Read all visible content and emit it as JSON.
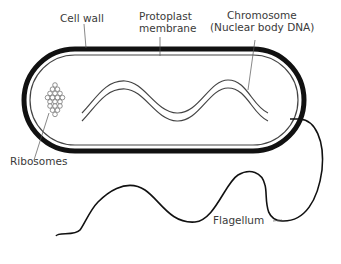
{
  "diagram": {
    "labels": {
      "cell_wall": "Cell wall",
      "protoplast_line1": "Protoplast",
      "protoplast_line2": "membrane",
      "chromosome_line1": "Chromosome",
      "chromosome_line2": "(Nuclear body DNA)",
      "ribosomes": "Ribosomes",
      "flagellum": "Flagellum"
    },
    "colors": {
      "wall": "#111111",
      "membrane": "#444444",
      "text": "#3a3a3a",
      "background": "#ffffff"
    }
  }
}
